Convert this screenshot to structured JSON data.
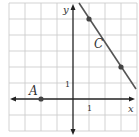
{
  "diagram": {
    "type": "coordinate-plane",
    "axis_labels": {
      "x": "x",
      "y": "y"
    },
    "tick_labels": {
      "x_one": "1",
      "y_one": "1"
    },
    "points": [
      {
        "label": "A",
        "coords": [
          -2,
          0
        ]
      }
    ],
    "lines": [
      {
        "label": "C",
        "through": [
          [
            1,
            5
          ],
          [
            3,
            2
          ]
        ]
      }
    ],
    "colors": {
      "grid": "#c8c8c8",
      "axis": "#222222",
      "line": "#555555",
      "point": "#444444"
    }
  }
}
